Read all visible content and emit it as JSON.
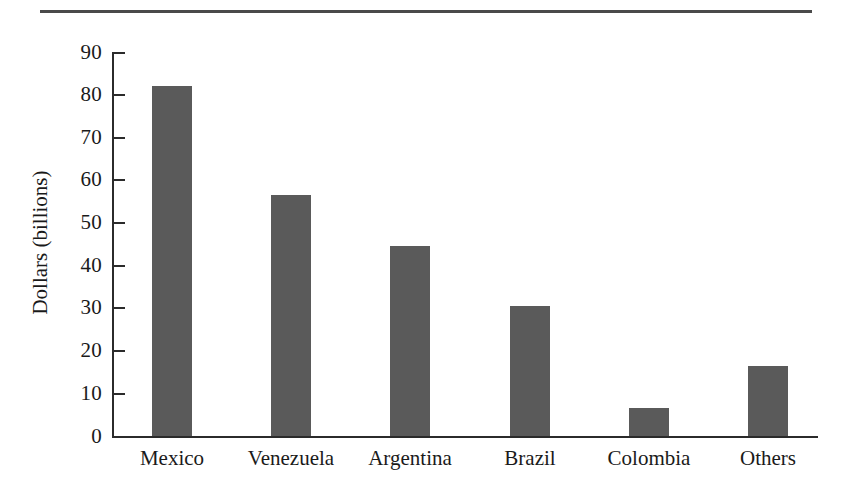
{
  "figure": {
    "top_rule": "horizontal-rule"
  },
  "chart_data": {
    "type": "bar",
    "title": "",
    "subtitle": "",
    "xlabel": "",
    "ylabel": "Dollars (billions)",
    "categories": [
      "Mexico",
      "Venezuela",
      "Argentina",
      "Brazil",
      "Colombia",
      "Others"
    ],
    "values": [
      82,
      56.5,
      44.5,
      30.5,
      6.5,
      16.5
    ],
    "series": [
      {
        "name": "Dollars (billions)",
        "values": [
          82,
          56.5,
          44.5,
          30.5,
          6.5,
          16.5
        ]
      }
    ],
    "ylim": [
      0,
      90
    ],
    "ytick_labels": [
      "90",
      "80",
      "70",
      "60",
      "50",
      "40",
      "30",
      "20",
      "10",
      "0"
    ],
    "ytick_values": [
      90,
      80,
      70,
      60,
      50,
      40,
      30,
      20,
      10,
      0
    ],
    "ytick_step": 10,
    "grid": false,
    "legend": false,
    "legend_position": "none",
    "bar_color": "#5a5a5a",
    "axis_color": "#2b2b2b",
    "background_color": "#ffffff"
  }
}
